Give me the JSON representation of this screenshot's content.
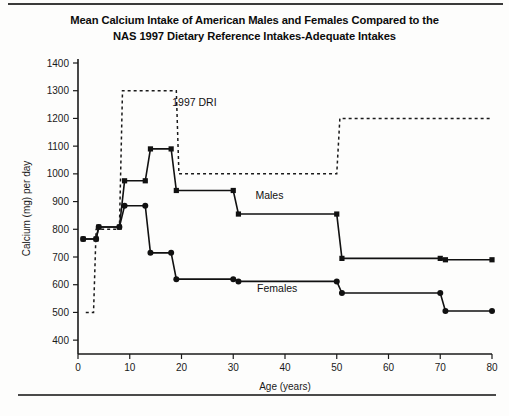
{
  "chart_data": {
    "type": "line",
    "title": "Mean Calcium Intake of American Males and Females Compared to the NAS 1997 Dietary Reference Intakes-Adequate Intakes",
    "title_line1": "Mean Calcium Intake of American Males and Females Compared to the",
    "title_line2": "NAS 1997 Dietary Reference Intakes-Adequate Intakes",
    "xlabel": "Age (years)",
    "ylabel": "Calcium (mg) per day",
    "xlim": [
      0,
      80
    ],
    "ylim": [
      350,
      1400
    ],
    "xticks": [
      0,
      10,
      20,
      30,
      40,
      50,
      60,
      70,
      80
    ],
    "yticks": [
      400,
      500,
      600,
      700,
      800,
      900,
      1000,
      1100,
      1200,
      1300,
      1400
    ],
    "grid": false,
    "legend_position": "inline-annotations",
    "series": [
      {
        "name": "Males",
        "marker": "square",
        "style": "solid",
        "points": [
          {
            "x": 1.0,
            "y": 765
          },
          {
            "x": 3.5,
            "y": 765
          },
          {
            "x": 4.0,
            "y": 808
          },
          {
            "x": 8.0,
            "y": 808
          },
          {
            "x": 9.0,
            "y": 975
          },
          {
            "x": 13.0,
            "y": 975
          },
          {
            "x": 14.0,
            "y": 1090
          },
          {
            "x": 18.0,
            "y": 1090
          },
          {
            "x": 19.0,
            "y": 940
          },
          {
            "x": 30.0,
            "y": 940
          },
          {
            "x": 31.0,
            "y": 855
          },
          {
            "x": 50.0,
            "y": 855
          },
          {
            "x": 51.0,
            "y": 695
          },
          {
            "x": 70.0,
            "y": 695
          },
          {
            "x": 71.0,
            "y": 690
          },
          {
            "x": 80.0,
            "y": 690
          }
        ]
      },
      {
        "name": "Females",
        "marker": "circle",
        "style": "solid",
        "points": [
          {
            "x": 1.0,
            "y": 765
          },
          {
            "x": 3.5,
            "y": 765
          },
          {
            "x": 4.0,
            "y": 808
          },
          {
            "x": 8.0,
            "y": 808
          },
          {
            "x": 9.0,
            "y": 885
          },
          {
            "x": 13.0,
            "y": 885
          },
          {
            "x": 14.0,
            "y": 715
          },
          {
            "x": 18.0,
            "y": 715
          },
          {
            "x": 19.0,
            "y": 620
          },
          {
            "x": 30.0,
            "y": 620
          },
          {
            "x": 31.0,
            "y": 612
          },
          {
            "x": 50.0,
            "y": 612
          },
          {
            "x": 51.0,
            "y": 570
          },
          {
            "x": 70.0,
            "y": 570
          },
          {
            "x": 71.0,
            "y": 505
          },
          {
            "x": 80.0,
            "y": 505
          }
        ]
      },
      {
        "name": "1997 DRI",
        "marker": "none",
        "style": "dashed",
        "points": [
          {
            "x": 1.5,
            "y": 500
          },
          {
            "x": 3.0,
            "y": 500
          },
          {
            "x": 3.5,
            "y": 800
          },
          {
            "x": 8.0,
            "y": 800
          },
          {
            "x": 8.6,
            "y": 1300
          },
          {
            "x": 19.0,
            "y": 1300
          },
          {
            "x": 19.5,
            "y": 1000
          },
          {
            "x": 50.0,
            "y": 1000
          },
          {
            "x": 50.6,
            "y": 1200
          },
          {
            "x": 80.0,
            "y": 1200
          }
        ]
      }
    ],
    "annotations": [
      {
        "text": "1997 DRI",
        "x": 22.5,
        "y": 1245
      },
      {
        "text": "Males",
        "x": 37.0,
        "y": 910
      },
      {
        "text": "Females",
        "x": 38.5,
        "y": 575
      }
    ]
  }
}
